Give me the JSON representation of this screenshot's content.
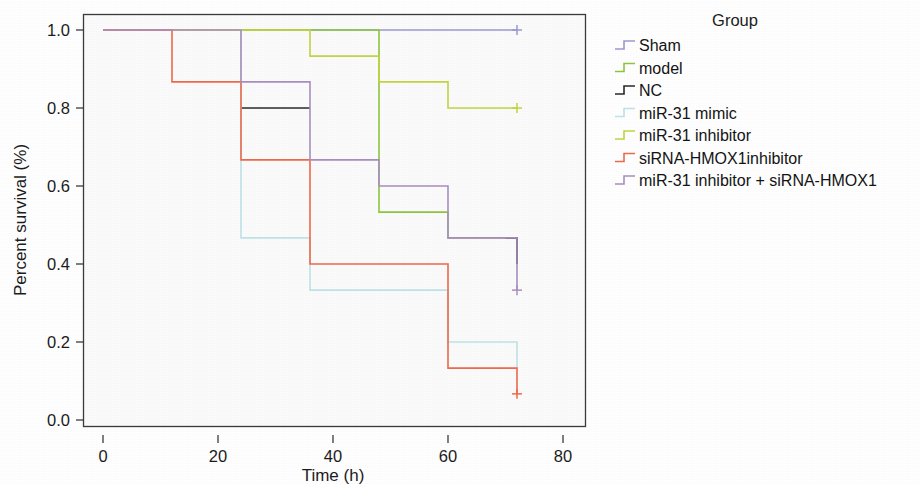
{
  "chart_data": {
    "type": "line",
    "title": "",
    "xlabel": "Time (h)",
    "ylabel": "Percent survival (%)",
    "xlim": [
      -4,
      84
    ],
    "ylim": [
      -0.03,
      1.06
    ],
    "xticks": [
      0,
      20,
      40,
      60,
      80
    ],
    "xticklabels": [
      "0",
      "20",
      "40",
      "60",
      "80"
    ],
    "yticks": [
      0.0,
      0.2,
      0.4,
      0.6,
      0.8,
      1.0
    ],
    "yticklabels": [
      "0.0",
      "0.2",
      "0.4",
      "0.6",
      "0.8",
      "1.0"
    ],
    "grid": false,
    "legend_position": "right",
    "legend_title": "Group",
    "step_style": "post",
    "series": [
      {
        "name": "Sham",
        "color": "#9a9ad2",
        "x": [
          0,
          72
        ],
        "y": [
          1.0,
          1.0
        ],
        "censored": [
          {
            "x": 72,
            "y": 1.0
          }
        ]
      },
      {
        "name": "model",
        "color": "#8ec63f",
        "x": [
          0,
          48,
          60,
          72
        ],
        "y": [
          1.0,
          0.533,
          0.467,
          0.4
        ],
        "censored": []
      },
      {
        "name": "NC",
        "color": "#2a2a2a",
        "x": [
          24,
          36
        ],
        "y": [
          0.8,
          0.8
        ],
        "segments_extra": [
          {
            "x": [
              70,
              72
            ],
            "y": [
              0.467,
              0.4
            ]
          }
        ],
        "censored": []
      },
      {
        "name": "miR-31 mimic",
        "color": "#bfe3e8",
        "x": [
          0,
          24,
          36,
          60,
          72
        ],
        "y": [
          1.0,
          0.467,
          0.333,
          0.2,
          0.133
        ],
        "censored": []
      },
      {
        "name": "miR-31 inhibitor",
        "color": "#c3d541",
        "x": [
          0,
          36,
          48,
          60,
          72
        ],
        "y": [
          1.0,
          0.933,
          0.867,
          0.8,
          0.8
        ],
        "censored": [
          {
            "x": 72,
            "y": 0.8
          }
        ]
      },
      {
        "name": "siRNA-HMOX1inhibitor",
        "color": "#ef6a4c",
        "x": [
          0,
          12,
          24,
          36,
          60,
          72
        ],
        "y": [
          1.0,
          0.867,
          0.667,
          0.4,
          0.133,
          0.067
        ],
        "censored": [
          {
            "x": 72,
            "y": 0.067
          }
        ]
      },
      {
        "name": "miR-31 inhibitor + siRNA-HMOX1",
        "color": "#a98fc0",
        "x": [
          0,
          24,
          36,
          48,
          60,
          72
        ],
        "y": [
          1.0,
          0.867,
          0.667,
          0.6,
          0.467,
          0.333
        ],
        "censored": [
          {
            "x": 72,
            "y": 0.333
          }
        ]
      }
    ]
  },
  "axes": {
    "x_label": "Time (h)",
    "y_label": "Percent survival (%)",
    "x_ticks": [
      "0",
      "20",
      "40",
      "60",
      "80"
    ],
    "y_ticks": [
      "1.0",
      "0.8",
      "0.6",
      "0.4",
      "0.2",
      "0.0"
    ]
  },
  "legend": {
    "title": "Group",
    "items": [
      {
        "label": "Sham",
        "color": "#9a9ad2"
      },
      {
        "label": "model",
        "color": "#8ec63f"
      },
      {
        "label": "NC",
        "color": "#2a2a2a"
      },
      {
        "label": "miR-31 mimic",
        "color": "#bfe3e8"
      },
      {
        "label": "miR-31 inhibitor",
        "color": "#c3d541"
      },
      {
        "label": "siRNA-HMOX1inhibitor",
        "color": "#ef6a4c"
      },
      {
        "label": "miR-31 inhibitor + siRNA-HMOX1",
        "color": "#a98fc0"
      }
    ]
  }
}
